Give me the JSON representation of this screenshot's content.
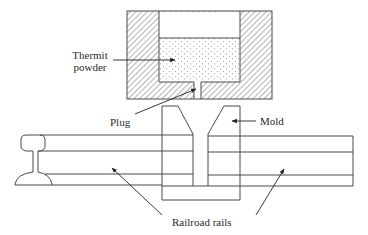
{
  "diagram": {
    "labels": {
      "thermit_line1": "Thermit",
      "thermit_line2": "powder",
      "plug": "Plug",
      "mold": "Mold",
      "rails": "Railroad rails"
    },
    "colors": {
      "line": "#4a4a4a",
      "hatch": "#6a6a6a",
      "powder_dots": "#9a9a9a",
      "background": "#ffffff"
    }
  }
}
